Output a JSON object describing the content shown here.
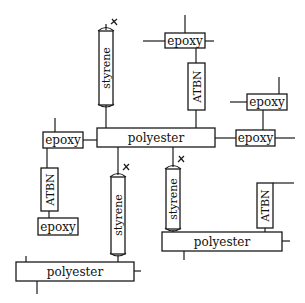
{
  "figure": {
    "type": "polymer network schematic",
    "nodes": {
      "styrene_top": "styrene",
      "epoxy_top": "epoxy",
      "atbn_top": "ATBN",
      "epoxy_right_upper": "epoxy",
      "epoxy_left": "epoxy",
      "polyester_main": "polyester",
      "epoxy_right_lower": "epoxy",
      "atbn_left": "ATBN",
      "epoxy_left_lower": "epoxy",
      "styrene_middle": "styrene",
      "styrene_right": "styrene",
      "atbn_right": "ATBN",
      "polyester_right": "polyester",
      "polyester_bottom": "polyester"
    },
    "crosslink_mark": "x"
  }
}
